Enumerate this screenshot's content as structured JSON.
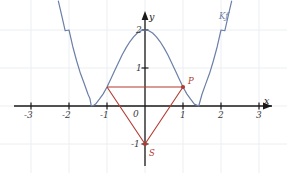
{
  "chart_data": {
    "type": "line",
    "title": "",
    "xlabel": "x",
    "ylabel": "y",
    "xlim": [
      -3.55,
      3.35
    ],
    "ylim": [
      -1.55,
      2.75
    ],
    "grid": true,
    "grid_spacing": 1,
    "legend_position": "none",
    "x_ticks": [
      -3,
      -2,
      -1,
      1,
      2,
      3
    ],
    "x_tick_labels": [
      "-3",
      "-2",
      "-1",
      "1",
      "2",
      "3"
    ],
    "y_ticks": [
      -1,
      1,
      2
    ],
    "y_tick_labels": [
      "-1",
      "1",
      "2"
    ],
    "origin_label": "0",
    "series": [
      {
        "name": "K_f",
        "label": "Kƒ",
        "color": "#6b7fa8",
        "kind": "quartic-parabola",
        "equation": "f(x) = 0.5*(x^2 - 2)^2",
        "vertex_y": 2,
        "roots": [
          -1.414,
          1.414
        ],
        "points": [
          [
            -2.28,
            2.76
          ],
          [
            -2.2,
            2.42
          ],
          [
            -2.1,
            1.98
          ],
          [
            -2.0,
            2.0
          ],
          [
            -1.9,
            1.56
          ],
          [
            -1.8,
            1.19
          ],
          [
            -1.7,
            0.86
          ],
          [
            -1.6,
            0.59
          ],
          [
            -1.5,
            0.31
          ],
          [
            -1.45,
            0.2
          ],
          [
            -1.414,
            0.0
          ],
          [
            -1.35,
            0.02
          ],
          [
            -1.3,
            0.05
          ],
          [
            -1.2,
            0.18
          ],
          [
            -1.1,
            0.32
          ],
          [
            -1.0,
            0.5
          ],
          [
            -0.9,
            0.71
          ],
          [
            -0.8,
            0.93
          ],
          [
            -0.7,
            1.14
          ],
          [
            -0.6,
            1.35
          ],
          [
            -0.5,
            1.53
          ],
          [
            -0.4,
            1.69
          ],
          [
            -0.3,
            1.82
          ],
          [
            -0.2,
            1.92
          ],
          [
            -0.1,
            1.98
          ],
          [
            0.0,
            2.0
          ],
          [
            0.1,
            1.98
          ],
          [
            0.2,
            1.92
          ],
          [
            0.3,
            1.82
          ],
          [
            0.4,
            1.69
          ],
          [
            0.5,
            1.53
          ],
          [
            0.6,
            1.35
          ],
          [
            0.7,
            1.14
          ],
          [
            0.8,
            0.93
          ],
          [
            0.9,
            0.71
          ],
          [
            1.0,
            0.5
          ],
          [
            1.1,
            0.32
          ],
          [
            1.2,
            0.18
          ],
          [
            1.3,
            0.05
          ],
          [
            1.414,
            0.0
          ],
          [
            1.5,
            0.31
          ],
          [
            1.6,
            0.59
          ],
          [
            1.7,
            0.86
          ],
          [
            1.8,
            1.19
          ],
          [
            1.9,
            1.56
          ],
          [
            2.0,
            2.0
          ],
          [
            2.1,
            1.98
          ],
          [
            2.2,
            2.42
          ],
          [
            2.28,
            2.76
          ]
        ]
      }
    ],
    "annotations": {
      "color": "#b03a2e",
      "triangle": {
        "name": "triangle-P-S",
        "vertices": [
          [
            -1,
            0.5
          ],
          [
            1,
            0.5
          ],
          [
            0,
            -1
          ]
        ],
        "closed": false,
        "segments": [
          [
            [
              -1,
              0.5
            ],
            [
              1,
              0.5
            ]
          ],
          [
            [
              -1,
              0.5
            ],
            [
              0,
              -1
            ]
          ],
          [
            [
              1,
              0.5
            ],
            [
              0,
              -1
            ]
          ]
        ]
      },
      "points": [
        {
          "name": "P",
          "label": "P",
          "x": 1,
          "y": 0.5,
          "label_dx": 5,
          "label_dy": -6
        },
        {
          "name": "S",
          "label": "S",
          "x": 0,
          "y": -1,
          "label_dx": 4,
          "label_dy": 9
        }
      ]
    },
    "colors": {
      "curve": "#6b7fa8",
      "annotation": "#b03a2e",
      "axis": "#1a1a1a",
      "grid": "#eceef2",
      "background": "#ffffff",
      "tick_text": "#3a3a3a"
    }
  }
}
